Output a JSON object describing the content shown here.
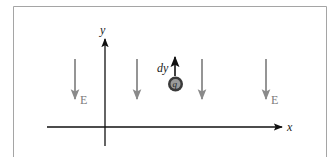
{
  "diagram": {
    "axes": {
      "x_label": "x",
      "y_label": "y"
    },
    "field": {
      "label": "E",
      "direction": "down",
      "arrow_count": 4,
      "arrows": [
        {
          "x": 75,
          "labeled": true,
          "label": "E"
        },
        {
          "x": 137,
          "labeled": false
        },
        {
          "x": 202,
          "labeled": false
        },
        {
          "x": 266,
          "labeled": true,
          "label": "E"
        }
      ]
    },
    "charge": {
      "label": "q",
      "displacement_label": "dy",
      "displacement_direction": "up"
    },
    "colors": {
      "frame": "#9a9a9a",
      "axes": "#111111",
      "field_arrows": "#8a8a8a",
      "field_label": "#7a7a7a",
      "charge_fill": "#3a3a3a",
      "charge_inner": "#9a9a9a",
      "background": "#ffffff"
    }
  }
}
